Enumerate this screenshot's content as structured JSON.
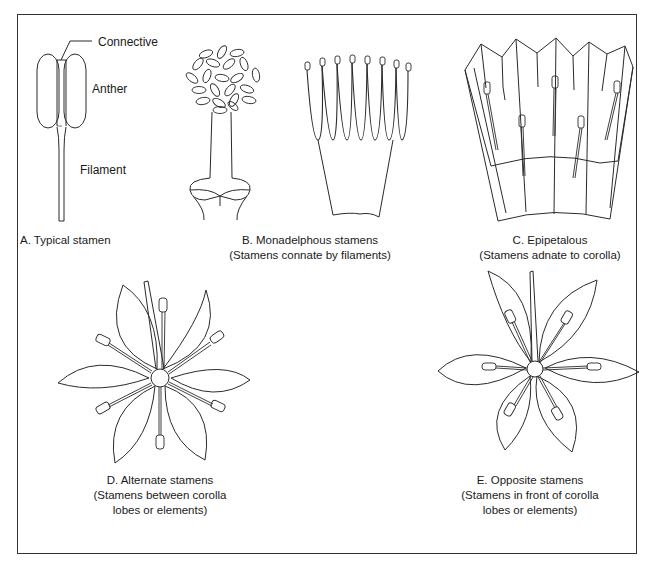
{
  "figure": {
    "panels": [
      {
        "id": "A",
        "caption_lines": [
          "A. Typical stamen"
        ],
        "parts": [
          {
            "name": "connective",
            "label": "Connective"
          },
          {
            "name": "anther",
            "label": "Anther"
          },
          {
            "name": "filament",
            "label": "Filament"
          }
        ]
      },
      {
        "id": "B",
        "caption_lines": [
          "B. Monadelphous stamens",
          "(Stamens connate by filaments)"
        ]
      },
      {
        "id": "C",
        "caption_lines": [
          "C. Epipetalous",
          "(Stamens adnate to corolla)"
        ]
      },
      {
        "id": "D",
        "caption_lines": [
          "D. Alternate stamens",
          "(Stamens between corolla",
          "lobes or elements)"
        ]
      },
      {
        "id": "E",
        "caption_lines": [
          "E. Opposite stamens",
          "(Stamens in front of corolla",
          "lobes or elements)"
        ]
      }
    ],
    "colors": {
      "line": "#2a2a2a",
      "background": "#ffffff",
      "frame": "#333333"
    }
  }
}
